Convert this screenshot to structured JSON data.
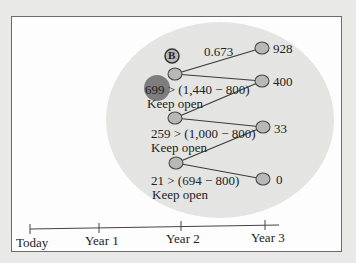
{
  "tree": {
    "node_label": "B",
    "branch_label": "0.673",
    "terminal_values": [
      "928",
      "400",
      "33",
      "0"
    ],
    "decisions": [
      {
        "rule": "699 > (1,440 − 800)",
        "action": "Keep open"
      },
      {
        "rule": "259 > (1,000 − 800)",
        "action": "Keep open"
      },
      {
        "rule": "21 > (694 − 800)",
        "action": "Keep open"
      }
    ]
  },
  "timeline": {
    "labels": [
      "Today",
      "Year 1",
      "Year 2",
      "Year 3"
    ]
  },
  "colors": {
    "highlight_ellipse": "#e4e4e2",
    "node_fill": "#b8b8b8",
    "node_stroke": "#4a4a4a",
    "highlight_dot": "#7d7d7d",
    "line": "#3a3a3a"
  }
}
